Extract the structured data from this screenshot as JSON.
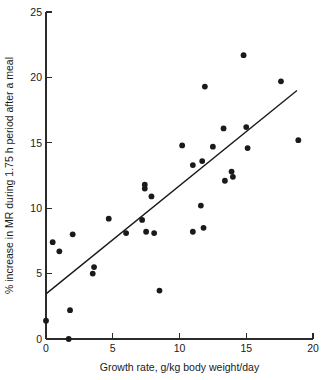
{
  "chart_data": {
    "type": "scatter",
    "title": "",
    "xlabel": "Growth rate, g/kg body weight/day",
    "ylabel": "% increase in MR during 1.75 h period after a meal",
    "xlim": [
      0,
      20
    ],
    "ylim": [
      0,
      25
    ],
    "xticks": [
      0,
      5,
      10,
      15,
      20
    ],
    "yticks": [
      0,
      5,
      10,
      15,
      20,
      25
    ],
    "xtick_labels": [
      "0",
      "5",
      "10",
      "15",
      "20"
    ],
    "ytick_labels": [
      "0",
      "5",
      "10",
      "15",
      "20",
      "25"
    ],
    "grid": false,
    "legend": null,
    "marker": "filled-circle",
    "marker_color": "#1a1a1a",
    "points": [
      {
        "x": 0.0,
        "y": 1.4
      },
      {
        "x": 0.5,
        "y": 7.4
      },
      {
        "x": 1.0,
        "y": 6.7
      },
      {
        "x": 1.7,
        "y": 0.0
      },
      {
        "x": 1.8,
        "y": 2.2
      },
      {
        "x": 2.0,
        "y": 8.0
      },
      {
        "x": 3.5,
        "y": 5.0
      },
      {
        "x": 3.6,
        "y": 5.5
      },
      {
        "x": 4.7,
        "y": 9.2
      },
      {
        "x": 6.0,
        "y": 8.1
      },
      {
        "x": 7.2,
        "y": 9.1
      },
      {
        "x": 7.4,
        "y": 11.5
      },
      {
        "x": 7.4,
        "y": 11.8
      },
      {
        "x": 7.5,
        "y": 8.2
      },
      {
        "x": 7.9,
        "y": 10.9
      },
      {
        "x": 8.1,
        "y": 8.1
      },
      {
        "x": 8.5,
        "y": 3.7
      },
      {
        "x": 10.2,
        "y": 14.8
      },
      {
        "x": 11.0,
        "y": 8.2
      },
      {
        "x": 11.0,
        "y": 13.3
      },
      {
        "x": 11.6,
        "y": 10.2
      },
      {
        "x": 11.7,
        "y": 13.6
      },
      {
        "x": 11.8,
        "y": 8.5
      },
      {
        "x": 11.9,
        "y": 19.3
      },
      {
        "x": 12.5,
        "y": 14.7
      },
      {
        "x": 13.3,
        "y": 16.1
      },
      {
        "x": 13.4,
        "y": 12.1
      },
      {
        "x": 13.9,
        "y": 12.8
      },
      {
        "x": 14.0,
        "y": 12.4
      },
      {
        "x": 14.8,
        "y": 21.7
      },
      {
        "x": 15.0,
        "y": 16.2
      },
      {
        "x": 15.1,
        "y": 14.6
      },
      {
        "x": 17.6,
        "y": 19.7
      },
      {
        "x": 18.9,
        "y": 15.2
      }
    ],
    "fit_line": {
      "type": "linear-regression",
      "x_start": 0.0,
      "y_start": 3.45,
      "x_end": 18.8,
      "y_end": 19.0
    }
  }
}
